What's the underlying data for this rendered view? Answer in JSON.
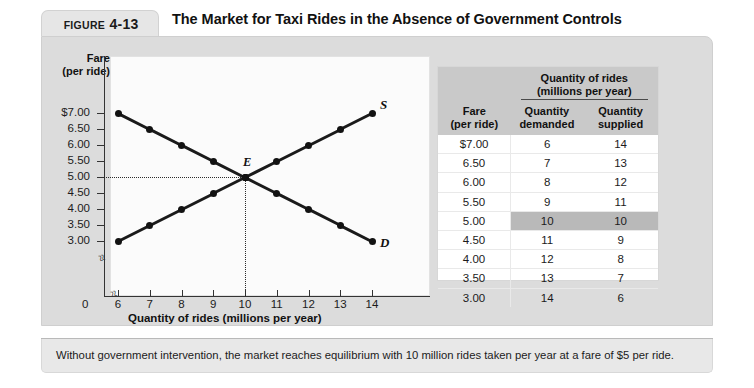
{
  "figure": {
    "label_word": "FIGURE",
    "number": "4-13",
    "title": "The Market for Taxi Rides in the Absence of Government Controls",
    "caption": "Without government intervention, the market reaches equilibrium with 10 million rides taken per year at a fare of $5 per ride."
  },
  "table": {
    "group_header": "Quantity of rides",
    "group_subheader": "(millions per year)",
    "col_fare": "Fare",
    "col_fare_sub": "(per ride)",
    "col_demanded": "Quantity",
    "col_demanded_sub": "demanded",
    "col_supplied": "Quantity",
    "col_supplied_sub": "supplied",
    "rows": [
      {
        "fare": "$7.00",
        "demanded": "6",
        "supplied": "14",
        "equilibrium": false
      },
      {
        "fare": "6.50",
        "demanded": "7",
        "supplied": "13",
        "equilibrium": false
      },
      {
        "fare": "6.00",
        "demanded": "8",
        "supplied": "12",
        "equilibrium": false
      },
      {
        "fare": "5.50",
        "demanded": "9",
        "supplied": "11",
        "equilibrium": false
      },
      {
        "fare": "5.00",
        "demanded": "10",
        "supplied": "10",
        "equilibrium": true
      },
      {
        "fare": "4.50",
        "demanded": "11",
        "supplied": "9",
        "equilibrium": false
      },
      {
        "fare": "4.00",
        "demanded": "12",
        "supplied": "8",
        "equilibrium": false
      },
      {
        "fare": "3.50",
        "demanded": "13",
        "supplied": "7",
        "equilibrium": false
      },
      {
        "fare": "3.00",
        "demanded": "14",
        "supplied": "6",
        "equilibrium": false
      }
    ]
  },
  "chart_data": {
    "type": "line",
    "title": "The Market for Taxi Rides in the Absence of Government Controls",
    "xlabel": "Quantity of rides (millions per year)",
    "ylabel": "Fare (per ride)",
    "ylabel_line1": "Fare",
    "ylabel_line2": "(per ride)",
    "origin_label": "0",
    "x": [
      6,
      7,
      8,
      9,
      10,
      11,
      12,
      13,
      14
    ],
    "xtick_labels": [
      "6",
      "7",
      "8",
      "9",
      "10",
      "11",
      "12",
      "13",
      "14"
    ],
    "ytick_labels": [
      "$7.00",
      "6.50",
      "6.00",
      "5.50",
      "5.00",
      "4.50",
      "4.00",
      "3.50",
      "3.00"
    ],
    "ytick_values": [
      7.0,
      6.5,
      6.0,
      5.5,
      5.0,
      4.5,
      4.0,
      3.5,
      3.0
    ],
    "xlim": [
      6,
      14
    ],
    "ylim": [
      3.0,
      7.0
    ],
    "grid": false,
    "axis_break_x": true,
    "axis_break_y": true,
    "series": [
      {
        "name": "Demand",
        "label": "D",
        "values": [
          7.0,
          6.5,
          6.0,
          5.5,
          5.0,
          4.5,
          4.0,
          3.5,
          3.0
        ]
      },
      {
        "name": "Supply",
        "label": "S",
        "values": [
          3.0,
          3.5,
          4.0,
          4.5,
          5.0,
          5.5,
          6.0,
          6.5,
          7.0
        ]
      }
    ],
    "annotations": [
      {
        "name": "equilibrium",
        "label": "E",
        "x": 10,
        "y": 5.0,
        "guide_lines": "dotted"
      }
    ]
  }
}
